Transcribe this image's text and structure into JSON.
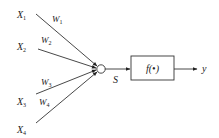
{
  "diagram": {
    "type": "neuron-model",
    "inputs": [
      {
        "label": "X",
        "sub": "1"
      },
      {
        "label": "X",
        "sub": "2"
      },
      {
        "label": "X",
        "sub": "3"
      },
      {
        "label": "X",
        "sub": "4"
      }
    ],
    "weights": [
      {
        "label": "W",
        "sub": "1"
      },
      {
        "label": "W",
        "sub": "2"
      },
      {
        "label": "W",
        "sub": "3"
      },
      {
        "label": "W",
        "sub": "4"
      }
    ],
    "sum_label": "S",
    "activation_label": "f(•)",
    "output_label": "y",
    "colors": {
      "stroke": "#333333",
      "text": "#222222",
      "background": "#ffffff"
    }
  }
}
